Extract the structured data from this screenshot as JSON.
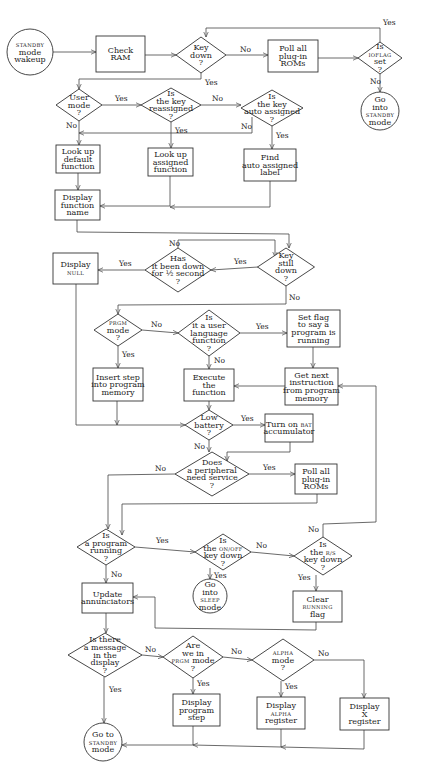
{
  "diagram": {
    "type": "flowchart",
    "nodes": [
      {
        "id": "start",
        "shape": "circle",
        "lines": [
          "STANDBY",
          "mode",
          "wakeup"
        ],
        "small": [
          0
        ]
      },
      {
        "id": "check_ram",
        "shape": "box",
        "lines": [
          "Check",
          "RAM"
        ]
      },
      {
        "id": "key_down",
        "shape": "diamond",
        "lines": [
          "Key",
          "down",
          "?"
        ]
      },
      {
        "id": "poll_roms_1",
        "shape": "box",
        "lines": [
          "Poll all",
          "plug-in",
          "ROMs"
        ]
      },
      {
        "id": "ioflag",
        "shape": "diamond",
        "lines": [
          "Is",
          "IOFLAG",
          "set",
          "?"
        ],
        "small": [
          1
        ]
      },
      {
        "id": "go_standby_1",
        "shape": "circle",
        "lines": [
          "Go",
          "into",
          "STANDBY",
          "mode"
        ],
        "small": [
          2
        ]
      },
      {
        "id": "user_mode",
        "shape": "diamond",
        "lines": [
          "User",
          "mode",
          "?"
        ]
      },
      {
        "id": "key_reassigned",
        "shape": "diamond",
        "lines": [
          "Is",
          "the key",
          "reassigned",
          "?"
        ]
      },
      {
        "id": "auto_assigned",
        "shape": "diamond",
        "lines": [
          "Is",
          "the key",
          "auto assigned",
          "?"
        ]
      },
      {
        "id": "lookup_default",
        "shape": "box",
        "lines": [
          "Look up",
          "default",
          "function"
        ]
      },
      {
        "id": "lookup_assigned",
        "shape": "box",
        "lines": [
          "Look up",
          "assigned",
          "function"
        ]
      },
      {
        "id": "find_auto_label",
        "shape": "box",
        "lines": [
          "Find",
          "auto assigned",
          "label"
        ]
      },
      {
        "id": "display_fn_name",
        "shape": "box",
        "lines": [
          "Display",
          "function",
          "name"
        ]
      },
      {
        "id": "display_null",
        "shape": "box",
        "lines": [
          "Display",
          "NULL"
        ],
        "small": [
          1
        ]
      },
      {
        "id": "half_second",
        "shape": "diamond",
        "lines": [
          "Has",
          "it been down",
          "for ½ second",
          "?"
        ]
      },
      {
        "id": "key_still_down",
        "shape": "diamond",
        "lines": [
          "Key",
          "still",
          "down",
          "?"
        ]
      },
      {
        "id": "prgm_mode",
        "shape": "diamond",
        "lines": [
          "PRGM",
          "mode",
          "?"
        ],
        "small": [
          0
        ]
      },
      {
        "id": "user_lang_fn",
        "shape": "diamond",
        "lines": [
          "Is",
          "it a user",
          "language",
          "function",
          "?"
        ]
      },
      {
        "id": "set_flag",
        "shape": "box",
        "lines": [
          "Set flag",
          "to say a",
          "program is",
          "running"
        ]
      },
      {
        "id": "insert_step",
        "shape": "box",
        "lines": [
          "Insert step",
          "into program",
          "memory"
        ]
      },
      {
        "id": "execute_fn",
        "shape": "box",
        "lines": [
          "Execute",
          "the",
          "function"
        ]
      },
      {
        "id": "get_next",
        "shape": "box",
        "lines": [
          "Get next",
          "instruction",
          "from program",
          "memory"
        ]
      },
      {
        "id": "low_battery",
        "shape": "diamond",
        "lines": [
          "Low",
          "battery",
          "?"
        ]
      },
      {
        "id": "bat_on",
        "shape": "box",
        "lines": [
          "Turn on BAT",
          "accumulator"
        ],
        "small_word": "BAT"
      },
      {
        "id": "peripheral",
        "shape": "diamond",
        "lines": [
          "Does",
          "a peripheral",
          "need service",
          "?"
        ]
      },
      {
        "id": "poll_roms_2",
        "shape": "box",
        "lines": [
          "Poll all",
          "plug-in",
          "ROMs"
        ]
      },
      {
        "id": "prog_running",
        "shape": "diamond",
        "lines": [
          "Is",
          "a program",
          "running",
          "?"
        ]
      },
      {
        "id": "onoff_down",
        "shape": "diamond",
        "lines": [
          "Is",
          "the ON/OFF",
          "key down",
          "?"
        ],
        "small_word": "ON/OFF"
      },
      {
        "id": "rs_down",
        "shape": "diamond",
        "lines": [
          "Is",
          "the R/S",
          "key down",
          "?"
        ],
        "small_word": "R/S"
      },
      {
        "id": "update_ann",
        "shape": "box",
        "lines": [
          "Update",
          "annunciators"
        ]
      },
      {
        "id": "go_sleep",
        "shape": "circle",
        "lines": [
          "Go",
          "into",
          "SLEEP",
          "mode"
        ],
        "small": [
          2
        ]
      },
      {
        "id": "clear_running",
        "shape": "box",
        "lines": [
          "Clear",
          "RUNNING",
          "flag"
        ],
        "small": [
          1
        ]
      },
      {
        "id": "message_display",
        "shape": "diamond",
        "lines": [
          "Is there",
          "a message",
          "in the",
          "display",
          "?"
        ]
      },
      {
        "id": "prgm_mode_2",
        "shape": "diamond",
        "lines": [
          "Are",
          "we in",
          "PRGM mode",
          "?"
        ],
        "small_word": "PRGM"
      },
      {
        "id": "alpha_mode",
        "shape": "diamond",
        "lines": [
          "ALPHA",
          "mode",
          "?"
        ],
        "small": [
          0
        ]
      },
      {
        "id": "display_step",
        "shape": "box",
        "lines": [
          "Display",
          "program",
          "step"
        ]
      },
      {
        "id": "display_alpha",
        "shape": "box",
        "lines": [
          "Display",
          "ALPHA",
          "register"
        ],
        "small": [
          1
        ]
      },
      {
        "id": "display_x",
        "shape": "box",
        "lines": [
          "Display",
          "X",
          "register"
        ]
      },
      {
        "id": "go_standby_2",
        "shape": "circle",
        "lines": [
          "Go to",
          "STANDBY",
          "mode"
        ],
        "small": [
          1
        ]
      }
    ],
    "edges": [
      {
        "from": "start",
        "to": "check_ram",
        "label": ""
      },
      {
        "from": "check_ram",
        "to": "key_down",
        "label": ""
      },
      {
        "from": "key_down",
        "to": "poll_roms_1",
        "label": "No"
      },
      {
        "from": "key_down",
        "to": "user_mode",
        "label": "Yes"
      },
      {
        "from": "poll_roms_1",
        "to": "ioflag",
        "label": ""
      },
      {
        "from": "ioflag",
        "to": "key_down",
        "label": "Yes"
      },
      {
        "from": "ioflag",
        "to": "go_standby_1",
        "label": "No"
      },
      {
        "from": "user_mode",
        "to": "key_reassigned",
        "label": "Yes"
      },
      {
        "from": "user_mode",
        "to": "lookup_default",
        "label": "No"
      },
      {
        "from": "key_reassigned",
        "to": "auto_assigned",
        "label": "No"
      },
      {
        "from": "key_reassigned",
        "to": "lookup_assigned",
        "label": "Yes"
      },
      {
        "from": "auto_assigned",
        "to": "lookup_default",
        "label": "No"
      },
      {
        "from": "auto_assigned",
        "to": "find_auto_label",
        "label": "Yes"
      },
      {
        "from": "lookup_default",
        "to": "display_fn_name",
        "label": ""
      },
      {
        "from": "lookup_assigned",
        "to": "display_fn_name",
        "label": ""
      },
      {
        "from": "find_auto_label",
        "to": "display_fn_name",
        "label": ""
      },
      {
        "from": "display_fn_name",
        "to": "key_still_down",
        "label": ""
      },
      {
        "from": "key_still_down",
        "to": "half_second",
        "label": "Yes"
      },
      {
        "from": "key_still_down",
        "to": "prgm_mode",
        "label": "No"
      },
      {
        "from": "half_second",
        "to": "display_null",
        "label": "Yes"
      },
      {
        "from": "half_second",
        "to": "key_still_down",
        "label": "No"
      },
      {
        "from": "display_null",
        "to": "low_battery",
        "label": ""
      },
      {
        "from": "prgm_mode",
        "to": "insert_step",
        "label": "Yes"
      },
      {
        "from": "prgm_mode",
        "to": "user_lang_fn",
        "label": "No"
      },
      {
        "from": "user_lang_fn",
        "to": "set_flag",
        "label": "Yes"
      },
      {
        "from": "user_lang_fn",
        "to": "execute_fn",
        "label": "No"
      },
      {
        "from": "set_flag",
        "to": "get_next",
        "label": ""
      },
      {
        "from": "get_next",
        "to": "execute_fn",
        "label": ""
      },
      {
        "from": "insert_step",
        "to": "low_battery",
        "label": ""
      },
      {
        "from": "execute_fn",
        "to": "low_battery",
        "label": ""
      },
      {
        "from": "low_battery",
        "to": "bat_on",
        "label": "Yes"
      },
      {
        "from": "low_battery",
        "to": "peripheral",
        "label": "No"
      },
      {
        "from": "bat_on",
        "to": "peripheral",
        "label": ""
      },
      {
        "from": "peripheral",
        "to": "poll_roms_2",
        "label": "Yes"
      },
      {
        "from": "peripheral",
        "to": "prog_running",
        "label": "No"
      },
      {
        "from": "poll_roms_2",
        "to": "prog_running",
        "label": ""
      },
      {
        "from": "prog_running",
        "to": "onoff_down",
        "label": "Yes"
      },
      {
        "from": "prog_running",
        "to": "update_ann",
        "label": "No"
      },
      {
        "from": "onoff_down",
        "to": "go_sleep",
        "label": "Yes"
      },
      {
        "from": "onoff_down",
        "to": "rs_down",
        "label": "No"
      },
      {
        "from": "rs_down",
        "to": "get_next",
        "label": "No"
      },
      {
        "from": "rs_down",
        "to": "clear_running",
        "label": "Yes"
      },
      {
        "from": "clear_running",
        "to": "update_ann",
        "label": ""
      },
      {
        "from": "update_ann",
        "to": "message_display",
        "label": ""
      },
      {
        "from": "message_display",
        "to": "go_standby_2",
        "label": "Yes"
      },
      {
        "from": "message_display",
        "to": "prgm_mode_2",
        "label": "No"
      },
      {
        "from": "prgm_mode_2",
        "to": "display_step",
        "label": "Yes"
      },
      {
        "from": "prgm_mode_2",
        "to": "alpha_mode",
        "label": "No"
      },
      {
        "from": "alpha_mode",
        "to": "display_alpha",
        "label": "Yes"
      },
      {
        "from": "alpha_mode",
        "to": "display_x",
        "label": "No"
      },
      {
        "from": "display_step",
        "to": "go_standby_2",
        "label": ""
      },
      {
        "from": "display_alpha",
        "to": "go_standby_2",
        "label": ""
      },
      {
        "from": "display_x",
        "to": "go_standby_2",
        "label": ""
      }
    ]
  },
  "labels": {
    "yes": "Yes",
    "no": "No"
  }
}
